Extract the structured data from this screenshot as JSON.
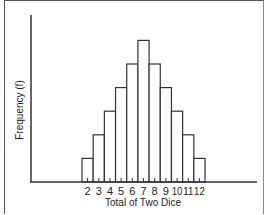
{
  "chart_data": {
    "type": "bar",
    "title": "",
    "xlabel": "Total of Two Dice",
    "ylabel": "Frequency (f)",
    "categories": [
      "2",
      "3",
      "4",
      "5",
      "6",
      "7",
      "8",
      "9",
      "10",
      "11",
      "12"
    ],
    "values": [
      1,
      2,
      3,
      4,
      5,
      6,
      5,
      4,
      3,
      2,
      1
    ],
    "ylim": [
      0,
      6
    ],
    "grid": false,
    "legend": null,
    "style": "histogram, adjacent unfilled bars with black outlines"
  },
  "colors": {
    "bar_fill": "#ffffff",
    "bar_stroke": "#333333",
    "axis": "#333333"
  }
}
